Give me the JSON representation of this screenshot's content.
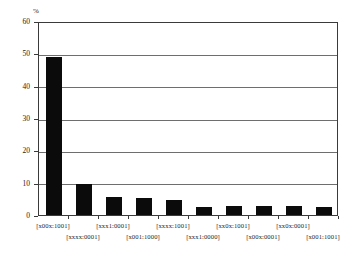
{
  "chart_data": {
    "type": "bar",
    "title": "",
    "subtitle": "",
    "xlabel": "",
    "ylabel": "%",
    "unit_label": "%",
    "ylim": [
      0,
      60
    ],
    "ytick_values": [
      0,
      10,
      20,
      30,
      40,
      50,
      60
    ],
    "ytick_labels": [
      "0",
      "10",
      "20",
      "30",
      "40",
      "50",
      "60"
    ],
    "grid": "horizontal",
    "legend": "none",
    "bar_color": "#0b0b0b",
    "categories": [
      "[x00x:1001]",
      "[xxxx:0001]",
      "[xxx1:0001]",
      "[x001:1000]",
      "[xxxx:1001]",
      "[xxx1:0000]",
      "[xx0x:1001]",
      "[x00x:0001]",
      "[xx0x:0001]",
      "[x001:1001]"
    ],
    "values": [
      49,
      9.5,
      5.6,
      5.3,
      4.7,
      2.6,
      2.8,
      2.7,
      2.8,
      2.5
    ],
    "label_rows": [
      0,
      1,
      0,
      1,
      0,
      1,
      0,
      1,
      0,
      1
    ]
  },
  "axis": {
    "y_unit": "%"
  }
}
